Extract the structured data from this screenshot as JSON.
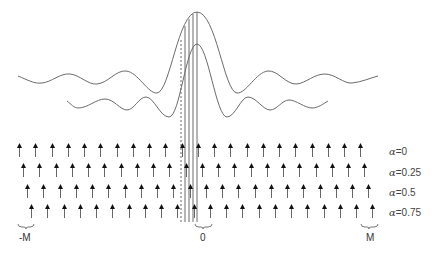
{
  "figure": {
    "colors": {
      "curve": "#6b6b6b",
      "arrow_head": "#111111",
      "arrow_shaft": "#666666",
      "text": "#333333"
    },
    "curves": [
      {
        "name": "upper-kernel",
        "peak_x": 197,
        "peak_y": 12
      },
      {
        "name": "lower-kernel",
        "peak_x": 197,
        "peak_y": 44
      }
    ],
    "rows": [
      {
        "alpha_symbol": "α",
        "alpha_text": "=0",
        "offset_x": 0,
        "y": 143
      },
      {
        "alpha_symbol": "α",
        "alpha_text": "=0.25",
        "offset_x": 4,
        "y": 163
      },
      {
        "alpha_symbol": "α",
        "alpha_text": "=0.5",
        "offset_x": 8,
        "y": 184
      },
      {
        "alpha_symbol": "α",
        "alpha_text": "=0.75",
        "offset_x": 12,
        "y": 204
      }
    ],
    "arrows_per_row": 22,
    "arrow_spacing": 16.25,
    "first_arrow_x": 19,
    "axis_labels": [
      {
        "text": "-M",
        "x": 26
      },
      {
        "text": "0",
        "x": 203
      },
      {
        "text": "M",
        "x": 370
      }
    ]
  }
}
